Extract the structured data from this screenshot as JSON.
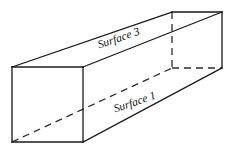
{
  "figure": {
    "background_color": "#ffffff",
    "line_color": "#1a1a1a",
    "hidden_line_color": "#2b2b2b",
    "face_color": "#ffffff",
    "stroke_width": 1.3,
    "hidden_stroke_width": 1.3,
    "hidden_dash_pattern": "7 5",
    "canvas": {
      "width": 236,
      "height": 156
    }
  },
  "geometry": {
    "description": "Long rectangular box seen from upper-left, extending to the upper-right.",
    "vertices": {
      "front_top_left": {
        "x": 12,
        "y": 67
      },
      "front_top_right": {
        "x": 83,
        "y": 67
      },
      "front_bottom_right": {
        "x": 83,
        "y": 142
      },
      "front_bottom_left": {
        "x": 12,
        "y": 142
      },
      "back_top_left": {
        "x": 172,
        "y": 12
      },
      "back_top_right": {
        "x": 222,
        "y": 12
      },
      "back_bottom_right": {
        "x": 222,
        "y": 68
      },
      "back_bottom_left": {
        "x": 172,
        "y": 68
      }
    },
    "visible_edges": [
      {
        "name": "front-face-top",
        "from": "front_top_left",
        "to": "front_top_right"
      },
      {
        "name": "front-face-right",
        "from": "front_top_right",
        "to": "front_bottom_right"
      },
      {
        "name": "front-face-bottom",
        "from": "front_bottom_right",
        "to": "front_bottom_left"
      },
      {
        "name": "front-face-left",
        "from": "front_bottom_left",
        "to": "front_top_left"
      },
      {
        "name": "top-left-receding",
        "from": "front_top_left",
        "to": "back_top_left"
      },
      {
        "name": "top-right-receding",
        "from": "front_top_right",
        "to": "back_top_right"
      },
      {
        "name": "bottom-right-receding",
        "from": "front_bottom_right",
        "to": "back_bottom_right"
      },
      {
        "name": "back-face-top",
        "from": "back_top_left",
        "to": "back_top_right"
      },
      {
        "name": "back-face-right",
        "from": "back_top_right",
        "to": "back_bottom_right"
      }
    ],
    "hidden_edges": [
      {
        "name": "back-face-left-vertical",
        "from": "back_top_left",
        "to": "back_bottom_left"
      },
      {
        "name": "back-face-bottom",
        "from": "back_bottom_left",
        "to": "back_bottom_right"
      },
      {
        "name": "bottom-left-receding",
        "from": "front_bottom_left",
        "to": "back_bottom_left"
      }
    ]
  },
  "labels": {
    "surface_3": {
      "text": "Surface 3",
      "x": 119,
      "y": 39,
      "rotation_deg": -19,
      "font_size": 11.5,
      "color": "#111111",
      "describes": "top face of the prism"
    },
    "surface_1": {
      "text": "Surface 1",
      "x": 135,
      "y": 103,
      "rotation_deg": -19,
      "font_size": 11.5,
      "color": "#111111",
      "describes": "front-lower face of the prism"
    }
  }
}
